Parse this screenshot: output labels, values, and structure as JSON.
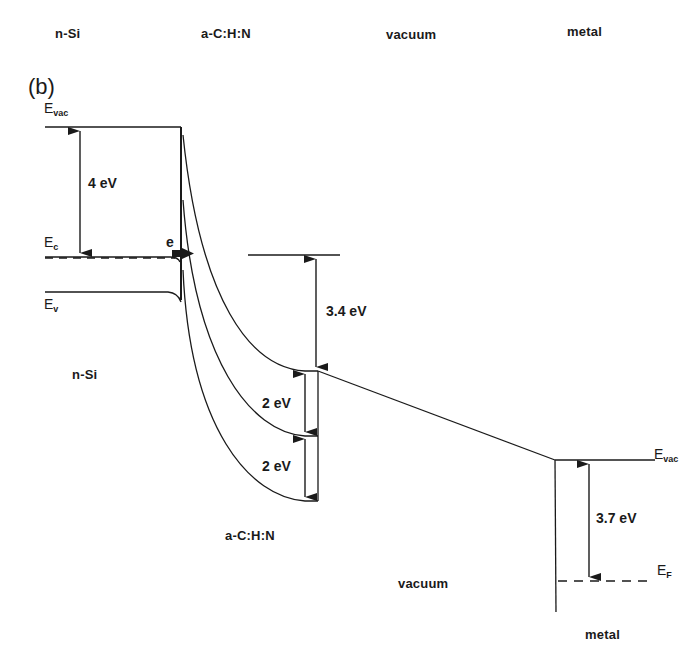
{
  "header": {
    "columns": [
      "n-Si",
      "a-C:H:N",
      "vacuum",
      "metal"
    ]
  },
  "panel_label": "(b)",
  "levels": {
    "left_evac": {
      "main": "E",
      "sub": "vac"
    },
    "ec": {
      "main": "E",
      "sub": "c"
    },
    "ev": {
      "main": "E",
      "sub": "v"
    },
    "electron": "e",
    "right_evac": {
      "main": "E",
      "sub": "vac"
    },
    "ef": {
      "main": "E",
      "sub": "F"
    }
  },
  "energies": {
    "si_affinity": "4 eV",
    "acn_barrier": "3.4 eV",
    "gap_upper": "2 eV",
    "gap_lower": "2 eV",
    "metal_workfunction": "3.7 eV"
  },
  "regions": {
    "nsi": "n-Si",
    "acn": "a-C:H:N",
    "vacuum": "vacuum",
    "metal": "metal"
  },
  "colors": {
    "line": "#1a1a1a",
    "background": "#ffffff"
  }
}
